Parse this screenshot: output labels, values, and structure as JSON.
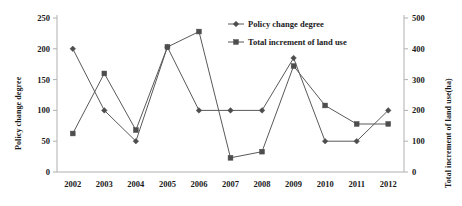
{
  "chart_data": {
    "type": "line",
    "title": "",
    "xlabel": "",
    "categories": [
      "2002",
      "2003",
      "2004",
      "2005",
      "2006",
      "2007",
      "2008",
      "2009",
      "2010",
      "2011",
      "2012"
    ],
    "grid": false,
    "legend_position": "top-right",
    "axes": {
      "left": {
        "label": "Policy change degree",
        "ylim": [
          0,
          250
        ],
        "ticks": [
          0,
          50,
          100,
          150,
          200,
          250
        ],
        "tick_labels": [
          "0",
          "50",
          "100",
          "150",
          "200",
          "250"
        ]
      },
      "right": {
        "label": "Total increment of land use(ha)",
        "ylim": [
          0,
          500
        ],
        "ticks": [
          0,
          100,
          200,
          300,
          400,
          500
        ],
        "tick_labels": [
          "0",
          "100",
          "200",
          "300",
          "400",
          "500"
        ]
      }
    },
    "series": [
      {
        "name": "Policy change degree",
        "axis": "left",
        "marker": "diamond",
        "color": "#595959",
        "values": [
          200,
          100,
          50,
          203,
          100,
          100,
          100,
          185,
          50,
          50,
          100
        ]
      },
      {
        "name": "Total  increment of land use",
        "axis": "right",
        "marker": "square",
        "color": "#595959",
        "values": [
          125,
          320,
          136,
          406,
          456,
          46,
          66,
          344,
          216,
          156,
          156
        ]
      }
    ]
  },
  "legend": {
    "items": [
      {
        "label": "Policy change degree",
        "marker": "diamond"
      },
      {
        "label": "Total  increment of land use",
        "marker": "square"
      }
    ]
  }
}
